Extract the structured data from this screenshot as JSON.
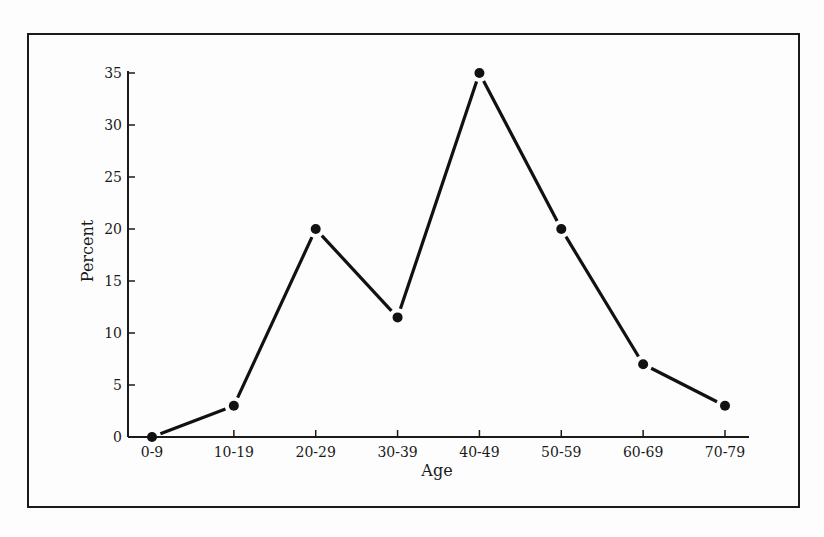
{
  "chart_data": {
    "type": "line",
    "title": "",
    "xlabel": "Age",
    "ylabel": "Percent",
    "categories": [
      "0-9",
      "10-19",
      "20-29",
      "30-39",
      "40-49",
      "50-59",
      "60-69",
      "70-79"
    ],
    "series": [
      {
        "name": "Percent",
        "values": [
          0,
          3,
          20,
          11.5,
          35,
          20,
          7,
          3
        ]
      }
    ],
    "ylim": [
      0,
      35
    ],
    "yticks": [
      0,
      5,
      10,
      15,
      20,
      25,
      30,
      35
    ],
    "grid": false,
    "legend": null,
    "markers": "filled-circle",
    "colors": {
      "line": "#111111",
      "axis": "#1a1a1a",
      "background": "#fdfdfd"
    }
  }
}
